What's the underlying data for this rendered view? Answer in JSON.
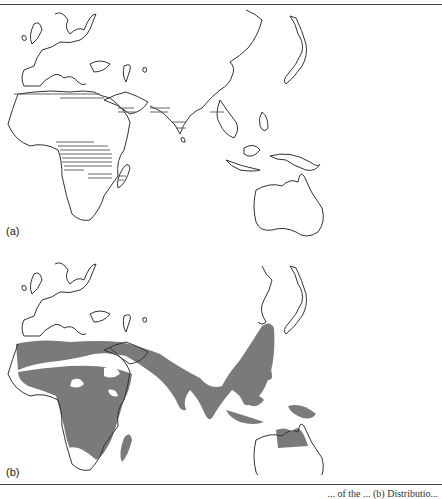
{
  "figure": {
    "panels": [
      {
        "label": "(a)",
        "style": "outline map with horizontal hatching",
        "regions_hatched": [
          "North Africa coast",
          "Arabian Peninsula",
          "Persian Gulf",
          "India",
          "Southeast Asia",
          "Central Africa",
          "Madagascar"
        ]
      },
      {
        "label": "(b)",
        "style": "outline map with gray shaded distribution",
        "fill_color": "#7a7a7a",
        "regions_shaded": [
          "North Africa / Sahel",
          "Central & East Africa",
          "Madagascar coast",
          "Middle East",
          "Indian subcontinent",
          "China",
          "Southeast Asia",
          "Philippines",
          "Indonesia",
          "New Guinea",
          "Northern Australia"
        ]
      }
    ],
    "caption_visible": "... of the ... (b) Distributio..."
  },
  "colors": {
    "outline": "#333333",
    "shade": "#7a7a7a",
    "background": "#ffffff"
  }
}
